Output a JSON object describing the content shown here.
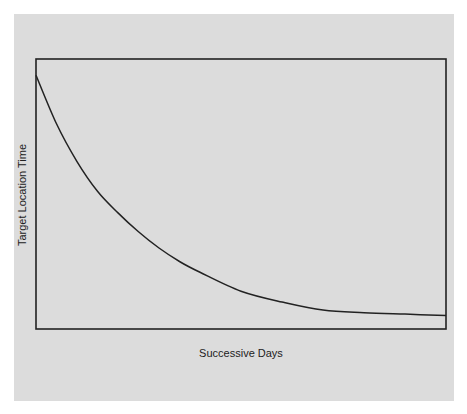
{
  "chart_data": {
    "type": "line",
    "title": "",
    "xlabel": "Successive Days",
    "ylabel": "Target Location Time",
    "x_ticks": [],
    "y_ticks": [],
    "grid": false,
    "legend": null,
    "xlim": [
      0,
      1
    ],
    "ylim": [
      0,
      1
    ],
    "series": [
      {
        "name": "Target Location Time",
        "x": [
          0.0,
          0.05,
          0.1,
          0.15,
          0.2,
          0.25,
          0.3,
          0.35,
          0.4,
          0.5,
          0.6,
          0.7,
          0.8,
          0.9,
          1.0
        ],
        "y": [
          0.94,
          0.76,
          0.62,
          0.51,
          0.43,
          0.36,
          0.3,
          0.25,
          0.21,
          0.14,
          0.1,
          0.07,
          0.06,
          0.055,
          0.05
        ]
      }
    ],
    "annotations": []
  },
  "colors": {
    "panel_background": "#dcdcdc",
    "frame": "#222222",
    "curve": "#222222"
  }
}
